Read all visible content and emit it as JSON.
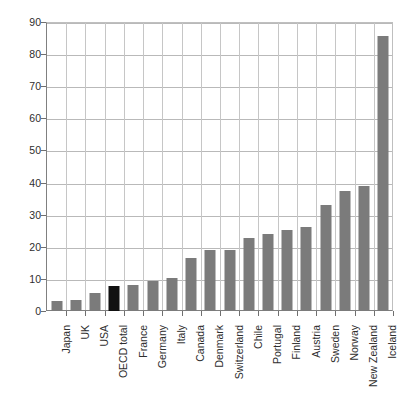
{
  "chart_data": {
    "type": "bar",
    "title": "",
    "subtitle": "",
    "xlabel": "",
    "ylabel": "",
    "ylim": [
      0,
      90
    ],
    "ytick_step": 10,
    "yticks": [
      0,
      10,
      20,
      30,
      40,
      50,
      60,
      70,
      80,
      90
    ],
    "ytick_labels": [
      "0",
      "10",
      "20",
      "30",
      "40",
      "50",
      "60",
      "70",
      "80",
      "90"
    ],
    "grid": true,
    "legend": "none",
    "categories": [
      "Japan",
      "UK",
      "USA",
      "OECD total",
      "France",
      "Germany",
      "Italy",
      "Canada",
      "Denmark",
      "Switzerland",
      "Chile",
      "Portugal",
      "Finland",
      "Austria",
      "Sweden",
      "Norway",
      "New Zealand",
      "Iceland"
    ],
    "values": [
      3.1,
      3.4,
      5.6,
      7.9,
      8.1,
      9.5,
      10.2,
      16.5,
      19.0,
      19.0,
      22.8,
      24.0,
      25.1,
      26.2,
      33.0,
      37.5,
      38.8,
      85.5
    ],
    "bar_colors": [
      "#7b7b7b",
      "#7b7b7b",
      "#7b7b7b",
      "#111111",
      "#7b7b7b",
      "#7b7b7b",
      "#7b7b7b",
      "#7b7b7b",
      "#7b7b7b",
      "#7b7b7b",
      "#7b7b7b",
      "#7b7b7b",
      "#7b7b7b",
      "#7b7b7b",
      "#7b7b7b",
      "#7b7b7b",
      "#7b7b7b",
      "#7b7b7b"
    ],
    "highlight_category": "OECD total",
    "colors": {
      "bar_default": "#7b7b7b",
      "bar_highlight": "#111111",
      "gridline": "#b9b9b9",
      "axis": "#6f6f6f",
      "text": "#2e2e2e",
      "background": "#ffffff"
    }
  }
}
